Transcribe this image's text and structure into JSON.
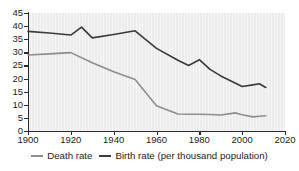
{
  "chart_data": {
    "type": "line",
    "title": "",
    "xlabel": "",
    "ylabel": "",
    "xlim": [
      1900,
      2020
    ],
    "ylim": [
      0,
      45
    ],
    "grid": false,
    "legend_position": "bottom",
    "units_note": "per thousand population",
    "x_ticks": [
      "1900",
      "1920",
      "1940",
      "1960",
      "1980",
      "2000",
      "2020"
    ],
    "y_ticks": [
      "0",
      "5",
      "10",
      "15",
      "20",
      "25",
      "30",
      "35",
      "40",
      "45"
    ],
    "series": [
      {
        "name": "Birth rate",
        "color": "#3a3a3a",
        "x": [
          1900,
          1910,
          1920,
          1925,
          1930,
          1940,
          1950,
          1960,
          1970,
          1975,
          1980,
          1985,
          1990,
          1995,
          2000,
          2005,
          2008,
          2011
        ],
        "values": [
          38.0,
          37.4,
          36.6,
          39.6,
          35.5,
          36.8,
          38.2,
          31.5,
          27.0,
          25.0,
          27.2,
          23.5,
          21.0,
          19.0,
          17.0,
          17.6,
          18.0,
          16.6
        ]
      },
      {
        "name": "Death rate",
        "color": "#8d8d8d",
        "x": [
          1900,
          1910,
          1920,
          1930,
          1940,
          1950,
          1960,
          1970,
          1975,
          1980,
          1985,
          1990,
          1997,
          2000,
          2005,
          2008,
          2011
        ],
        "values": [
          29.0,
          29.4,
          29.9,
          26.0,
          22.6,
          19.6,
          9.6,
          6.5,
          6.4,
          6.4,
          6.3,
          6.1,
          6.9,
          6.2,
          5.4,
          5.6,
          5.8
        ]
      }
    ]
  },
  "legend": {
    "death_label": "Death rate",
    "birth_label": "Birth rate (per thousand population)"
  }
}
